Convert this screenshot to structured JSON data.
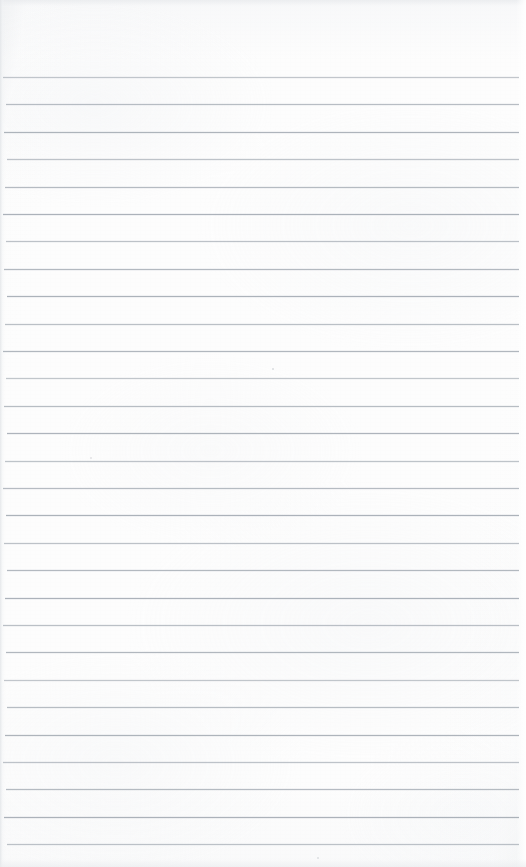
{
  "document": {
    "kind": "scanned-page",
    "title": "Blank ruled notebook page",
    "page_width": 526,
    "page_height": 867,
    "paper_color": "#fdfdfd",
    "rule_color": "#9aa2ab",
    "body_text": "",
    "has_header_text": false,
    "has_body_text": false,
    "has_page_number": false,
    "has_margin_rule": false
  },
  "ruling": {
    "line_count": 29,
    "spacing_px": 27.4,
    "first_line_y": 77,
    "last_line_y": 845,
    "line_left_x": 3,
    "line_right_x": 519,
    "thickness_px": 1,
    "lines_y": [
      77,
      104.4,
      131.8,
      159.2,
      186.6,
      214,
      241.4,
      268.8,
      296.2,
      323.6,
      351,
      378.4,
      405.8,
      433.2,
      460.6,
      488,
      515.4,
      542.8,
      570.2,
      597.6,
      625,
      652.4,
      679.8,
      707.2,
      734.6,
      762,
      789.4,
      816.8,
      844.2
    ]
  },
  "artifacts": {
    "specks": [
      {
        "name": "speck-upper-middle",
        "x": 272,
        "y": 368,
        "size": 2.0,
        "opacity": 0.5
      },
      {
        "name": "speck-left-middle",
        "x": 90,
        "y": 457,
        "size": 1.6,
        "opacity": 0.35
      },
      {
        "name": "speck-bottom-middle",
        "x": 317,
        "y": 857,
        "size": 2.0,
        "opacity": 0.45
      }
    ]
  }
}
